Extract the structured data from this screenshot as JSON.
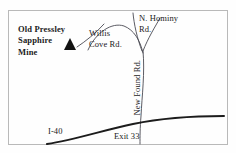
{
  "map": {
    "title": "Old Pressley Sapphire Mine location map",
    "frame": {
      "border_color": "#b9b9b9",
      "background_color": "#fefefe",
      "x": 8,
      "y": 10,
      "width": 220,
      "height": 135
    },
    "colors": {
      "road_line": "#4a4a52",
      "highway_line": "#1c1c1c",
      "text": "#1b1b1b",
      "marker": "#111111"
    },
    "marker": {
      "name": "sapphire-mine-marker",
      "shape": "triangle",
      "x": 70,
      "y": 45,
      "size": 11
    },
    "labels": [
      {
        "id": "mine",
        "name": "old-pressley-sapphire-mine-label",
        "lines": [
          "Old Pressley",
          "Sapphire",
          "Mine"
        ],
        "bold": true
      },
      {
        "id": "willis",
        "name": "willis-cove-rd-label",
        "lines": [
          "Willis",
          "Cove Rd."
        ],
        "bold": false
      },
      {
        "id": "hominy",
        "name": "n-hominy-rd-label",
        "lines": [
          "N. Hominy",
          "Rd."
        ],
        "bold": false
      },
      {
        "id": "newfound",
        "name": "new-found-rd-label",
        "lines": [
          "New Found Rd."
        ],
        "bold": false,
        "rotated": true
      },
      {
        "id": "i40",
        "name": "i-40-label",
        "lines": [
          "I-40"
        ],
        "bold": false
      },
      {
        "id": "exit33",
        "name": "exit-33-label",
        "lines": [
          "Exit 33"
        ],
        "bold": false
      }
    ],
    "text": {
      "mine_line1": "Old Pressley",
      "mine_line2": "Sapphire",
      "mine_line3": "Mine",
      "willis_line1": "Willis",
      "willis_line2": "Cove Rd.",
      "hominy_line1": "N. Hominy",
      "hominy_line2": "Rd.",
      "newfound": "New Found Rd.",
      "i40": "I-40",
      "exit33": "Exit 33"
    },
    "roads": [
      {
        "name": "willis-cove-rd-line",
        "label": "Willis Cove Rd.",
        "type": "secondary"
      },
      {
        "name": "willis-cove-rd-arc",
        "label": "Willis Cove Rd.",
        "type": "secondary"
      },
      {
        "name": "n-hominy-rd-line",
        "label": "N. Hominy Rd.",
        "type": "secondary"
      },
      {
        "name": "n-hominy-rd-branch",
        "label": "N. Hominy Rd. branch",
        "type": "secondary"
      },
      {
        "name": "new-found-rd-line",
        "label": "New Found Rd.",
        "type": "secondary"
      },
      {
        "name": "i-40-highway",
        "label": "I-40",
        "type": "interstate"
      }
    ]
  }
}
